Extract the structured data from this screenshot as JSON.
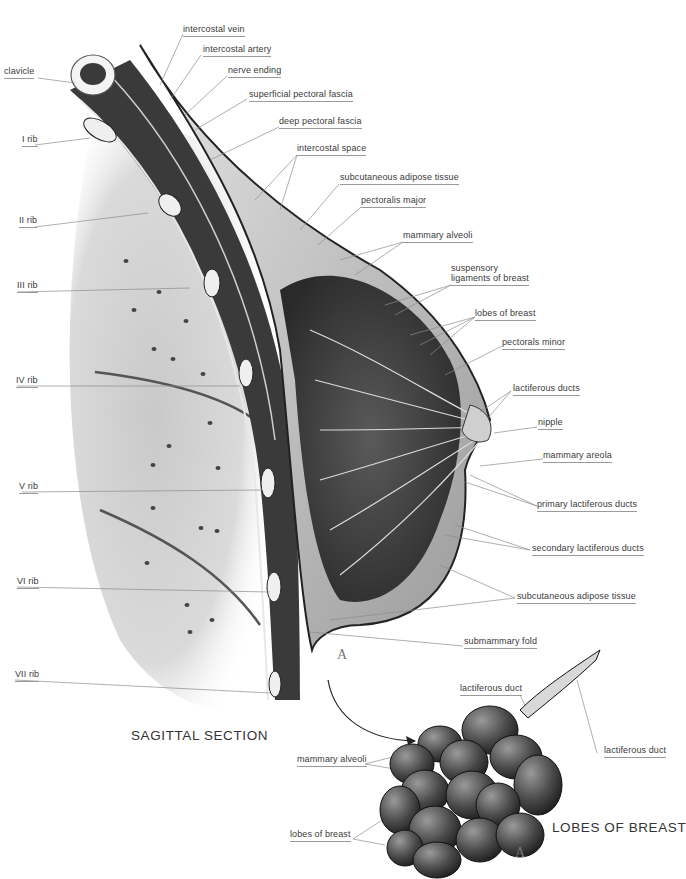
{
  "titles": {
    "sagittal": "SAGITTAL SECTION",
    "lobes": "LOBES OF BREAST",
    "marker": "A"
  },
  "labels_left": [
    {
      "id": "clavicle",
      "text": "clavicle"
    },
    {
      "id": "rib1",
      "text": "I rib"
    },
    {
      "id": "rib2",
      "text": "II rib"
    },
    {
      "id": "rib3",
      "text": "III rib"
    },
    {
      "id": "rib4",
      "text": "IV rib"
    },
    {
      "id": "rib5",
      "text": "V rib"
    },
    {
      "id": "rib6",
      "text": "VI rib"
    },
    {
      "id": "rib7",
      "text": "VII rib"
    }
  ],
  "labels_right": [
    {
      "id": "intercostal-vein",
      "text": "intercostal vein"
    },
    {
      "id": "intercostal-artery",
      "text": "intercostal artery"
    },
    {
      "id": "nerve-ending",
      "text": "nerve ending"
    },
    {
      "id": "superficial-pectoral-fascia",
      "text": "superficial pectoral fascia"
    },
    {
      "id": "deep-pectoral-fascia",
      "text": "deep pectoral fascia"
    },
    {
      "id": "intercostal-space",
      "text": "intercostal space"
    },
    {
      "id": "subcutaneous-adipose-tissue-upper",
      "text": "subcutaneous adipose tissue"
    },
    {
      "id": "pectoralis-major",
      "text": "pectoralis major"
    },
    {
      "id": "mammary-alveoli",
      "text": "mammary alveoli"
    },
    {
      "id": "suspensory-ligaments-1",
      "text": "suspensory"
    },
    {
      "id": "suspensory-ligaments-2",
      "text": "ligaments of breast"
    },
    {
      "id": "lobes-of-breast",
      "text": "lobes of breast"
    },
    {
      "id": "pectorals-minor",
      "text": "pectorals minor"
    },
    {
      "id": "lactiferous-ducts",
      "text": "lactiferous ducts"
    },
    {
      "id": "nipple",
      "text": "nipple"
    },
    {
      "id": "mammary-areola",
      "text": "mammary areola"
    },
    {
      "id": "primary-lactiferous-ducts",
      "text": "primary lactiferous ducts"
    },
    {
      "id": "secondary-lactiferous-ducts",
      "text": "secondary lactiferous ducts"
    },
    {
      "id": "subcutaneous-adipose-tissue-lower",
      "text": "subcutaneous adipose tissue"
    },
    {
      "id": "submammary-fold",
      "text": "submammary fold"
    }
  ],
  "labels_inset": [
    {
      "id": "inset-lactiferous-duct-1",
      "text": "lactiferous duct"
    },
    {
      "id": "inset-lactiferous-duct-2",
      "text": "lactiferous duct"
    },
    {
      "id": "inset-mammary-alveoli",
      "text": "mammary alveoli"
    },
    {
      "id": "inset-lobes-of-breast",
      "text": "lobes of breast"
    }
  ],
  "colors": {
    "background": "#ffffff",
    "label_text": "#3a3a3a",
    "leader_line": "#8c8c8c",
    "tissue_dark": "#2a2a2a",
    "tissue_mid": "#8a8a8a",
    "tissue_light": "#d6d6d6"
  }
}
